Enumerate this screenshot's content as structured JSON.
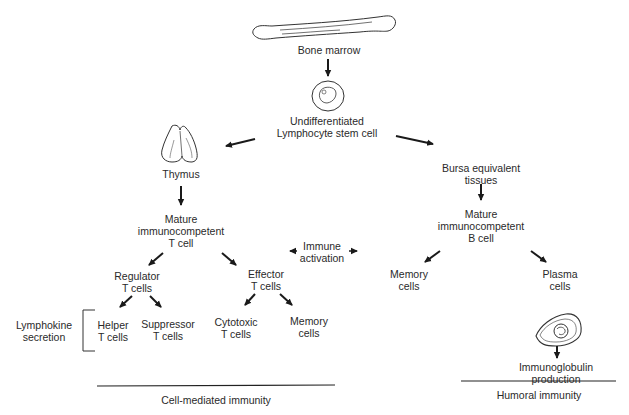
{
  "diagram": {
    "type": "flow",
    "nodes": {
      "bone_marrow": "Bone marrow",
      "stem_cell": "Undifferentiated\nLymphocyte stem cell",
      "thymus": "Thymus",
      "mature_t": "Mature\nimmunocompetent\nT cell",
      "immune_activation": "Immune\nactivation",
      "regulator_t": "Regulator\nT cells",
      "effector_t": "Effector\nT cells",
      "lymphokine": "Lymphokine\nsecretion",
      "helper_t": "Helper\nT cells",
      "suppressor_t": "Suppressor\nT cells",
      "cytotoxic_t": "Cytotoxic\nT cells",
      "memory_t": "Memory\ncells",
      "bursa": "Bursa equivalent\ntissues",
      "mature_b": "Mature\nimmunocompetent\nB cell",
      "memory_b": "Memory\ncells",
      "plasma": "Plasma\ncells",
      "immunoglobulin": "Immunoglobulin\nproduction"
    },
    "sections": {
      "cell_mediated": "Cell-mediated immunity",
      "humoral": "Humoral immunity"
    },
    "edges": [
      [
        "bone_marrow",
        "stem_cell"
      ],
      [
        "stem_cell",
        "thymus"
      ],
      [
        "stem_cell",
        "bursa"
      ],
      [
        "thymus",
        "mature_t"
      ],
      [
        "mature_t",
        "regulator_t"
      ],
      [
        "mature_t",
        "effector_t"
      ],
      [
        "regulator_t",
        "helper_t"
      ],
      [
        "regulator_t",
        "suppressor_t"
      ],
      [
        "effector_t",
        "cytotoxic_t"
      ],
      [
        "effector_t",
        "memory_t"
      ],
      [
        "bursa",
        "mature_b"
      ],
      [
        "mature_b",
        "memory_b"
      ],
      [
        "mature_b",
        "plasma"
      ],
      [
        "plasma",
        "immunoglobulin"
      ],
      [
        "immune_activation",
        "effector_t"
      ],
      [
        "immune_activation",
        "memory_b"
      ]
    ]
  }
}
